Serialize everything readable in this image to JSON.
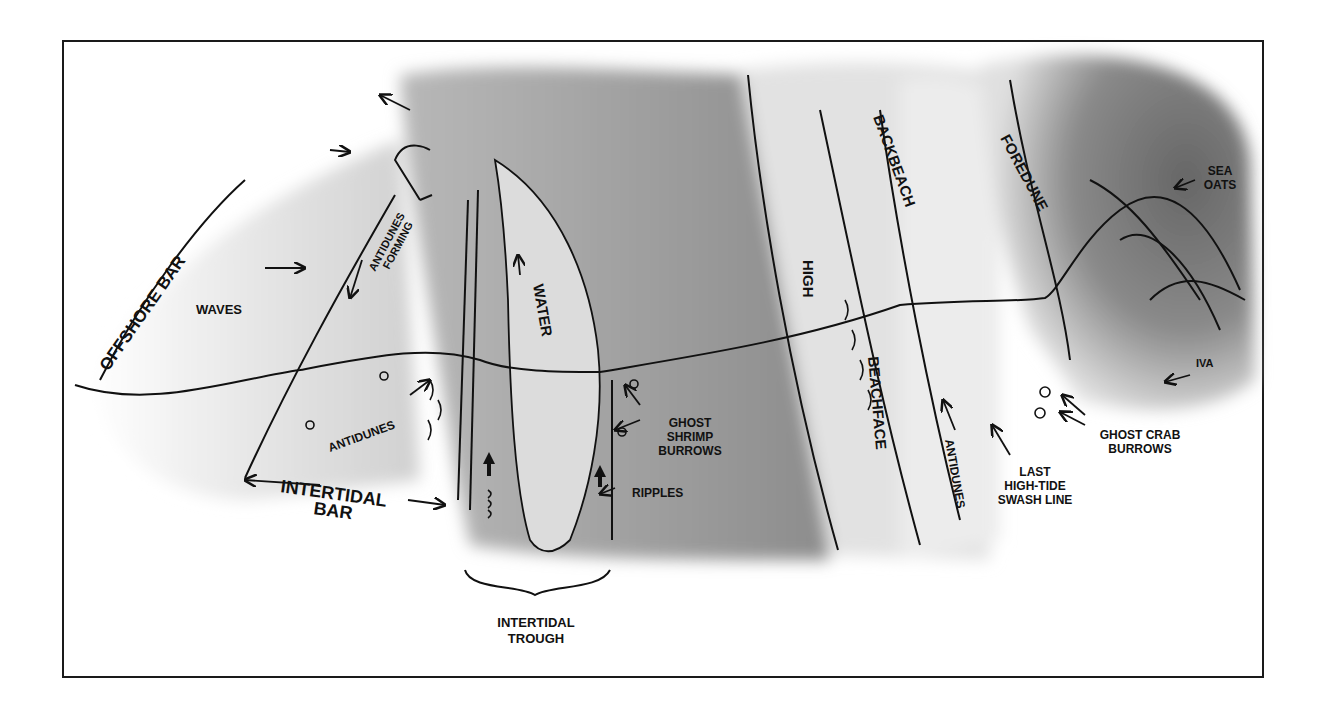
{
  "figure": {
    "type": "beach profile schematic (plan view)",
    "colors": {
      "frame": "#1a1a1a",
      "ink": "#111111",
      "light_sand": "#e8e8e8",
      "mid_gray": "#b5b5b5",
      "dark_gray": "#8a8a8a",
      "dune_dark": "#6e6e6e",
      "background": "#ffffff"
    }
  },
  "labels": {
    "offshore_bar": "OFFSHORE BAR",
    "waves": "WAVES",
    "antidunes_forming_1": "ANTIDUNES",
    "antidunes_forming_2": "FORMING",
    "water": "WATER",
    "antidunes_left": "ANTIDUNES",
    "intertidal_bar_1": "INTERTIDAL",
    "intertidal_bar_2": "BAR",
    "intertidal_trough_1": "INTERTIDAL",
    "intertidal_trough_2": "TROUGH",
    "ghost_shrimp_1": "GHOST",
    "ghost_shrimp_2": "SHRIMP",
    "ghost_shrimp_3": "BURROWS",
    "ripples": "RIPPLES",
    "high": "HIGH",
    "beachface": "BEACHFACE",
    "antidunes_right": "ANTIDUNES",
    "backbeach": "BACKBEACH",
    "last_swash_1": "LAST",
    "last_swash_2": "HIGH-TIDE",
    "last_swash_3": "SWASH LINE",
    "foredune": "FOREDUNE",
    "sea_oats_1": "SEA",
    "sea_oats_2": "OATS",
    "iva": "IVA",
    "ghost_crab_1": "GHOST CRAB",
    "ghost_crab_2": "BURROWS"
  }
}
